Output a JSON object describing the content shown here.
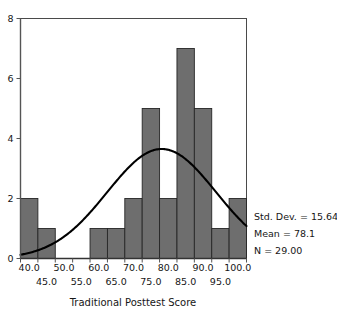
{
  "chart_data": {
    "type": "bar",
    "title": "",
    "subtitle": "",
    "xlabel": "Traditional Posttest Score",
    "ylabel": "",
    "xlim": [
      37.5,
      102.5
    ],
    "ylim": [
      0,
      8
    ],
    "grid": false,
    "legend_position": "none",
    "bin_width": 5,
    "categories": [
      "37.5-42.5",
      "42.5-47.5",
      "47.5-52.5",
      "52.5-57.5",
      "57.5-62.5",
      "62.5-67.5",
      "67.5-72.5",
      "72.5-77.5",
      "77.5-82.5",
      "82.5-87.5",
      "87.5-92.5",
      "92.5-97.5",
      "97.5-102.5"
    ],
    "bin_starts": [
      37.5,
      42.5,
      47.5,
      52.5,
      57.5,
      62.5,
      67.5,
      72.5,
      77.5,
      82.5,
      87.5,
      92.5,
      97.5
    ],
    "values": [
      2,
      1,
      0,
      0,
      1,
      1,
      2,
      5,
      2,
      7,
      5,
      1,
      2
    ],
    "x_tick_labels_row1": [
      "40.0",
      "50.0",
      "60.0",
      "70.0",
      "80.0",
      "90.0",
      "100.0"
    ],
    "x_tick_values_row1": [
      40,
      50,
      60,
      70,
      80,
      90,
      100
    ],
    "x_tick_labels_row2": [
      "45.0",
      "55.0",
      "65.0",
      "75.0",
      "85.0",
      "95.0"
    ],
    "x_tick_values_row2": [
      45,
      55,
      65,
      75,
      85,
      95
    ],
    "y_tick_labels": [
      "0",
      "2",
      "4",
      "6",
      "8"
    ],
    "y_tick_values": [
      0,
      2,
      4,
      6,
      8
    ],
    "overlay_curve": {
      "name": "normal",
      "mean": 78.1,
      "std_dev": 15.64,
      "n": 29,
      "peak_value": 3.65
    },
    "bar_color": "#6e6e6e",
    "bar_edge_color": "#262626",
    "curve_color": "#000000",
    "axis_color": "#555555",
    "frame_color": "#4a4a4a"
  },
  "annotations": {
    "std_dev_label": "Std. Dev. = 15.64",
    "mean_label": "Mean = 78.1",
    "n_label": "N = 29.00"
  },
  "axis": {
    "x_title": "Traditional Posttest Score"
  }
}
